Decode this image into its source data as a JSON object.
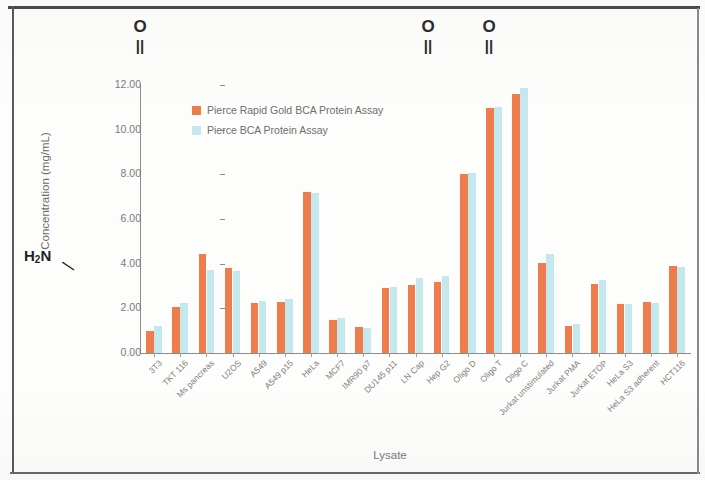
{
  "chart_data": {
    "type": "bar",
    "title": "",
    "xlabel": "Lysate",
    "ylabel": "Concentration (mg/mL)",
    "ylim": [
      0,
      12
    ],
    "y_ticks": [
      "0.00",
      "2.00",
      "4.00",
      "6.00",
      "8.00",
      "10.00",
      "12.00"
    ],
    "y_tick_values": [
      0,
      2,
      4,
      6,
      8,
      10,
      12
    ],
    "grid": false,
    "legend_position": "upper-left-inside",
    "categories": [
      "3T3",
      "TKT 116",
      "Ms pancreas",
      "U2OS",
      "A549",
      "A549 p15",
      "HeLa",
      "MCF7",
      "IMR90 p7",
      "DU145 p11",
      "LN Cap",
      "Hep G2",
      "Oligo D",
      "Oligo T",
      "Oligo C",
      "Jurkat unstimulated",
      "Jurkat PMA",
      "Jurkat ETOP",
      "HeLa S3",
      "HeLa S3 adherent",
      "HCT116"
    ],
    "series": [
      {
        "name": "Pierce Rapid Gold BCA Protein Assay",
        "color": "#ef7c4d",
        "values": [
          1.0,
          2.05,
          4.45,
          3.8,
          2.25,
          2.3,
          7.2,
          1.5,
          1.15,
          2.9,
          3.05,
          3.2,
          8.0,
          10.95,
          11.6,
          4.05,
          1.2,
          3.1,
          2.2,
          2.3,
          3.9
        ]
      },
      {
        "name": "Pierce BCA Protein Assay",
        "color": "#c5e7ee",
        "values": [
          1.2,
          2.25,
          3.7,
          3.65,
          2.35,
          2.4,
          7.15,
          1.55,
          1.1,
          2.95,
          3.35,
          3.45,
          8.05,
          11.0,
          11.85,
          4.45,
          1.3,
          3.25,
          2.2,
          2.25,
          3.85
        ]
      }
    ]
  },
  "annotations": {
    "carbonyl_o_label": "O",
    "carbonyl_bond_glyph": "||",
    "amine_label_html": "H<sub>2</sub>N",
    "carbonyl_positions_x": [
      140,
      428,
      489
    ]
  },
  "legend": {
    "entries": [
      {
        "label": "Pierce Rapid Gold BCA Protein Assay",
        "color": "#ef7c4d"
      },
      {
        "label": "Pierce BCA Protein Assay",
        "color": "#c5e7ee"
      }
    ]
  },
  "axes": {
    "x_title": "Lysate",
    "y_title": "Concentration (mg/mL)"
  }
}
